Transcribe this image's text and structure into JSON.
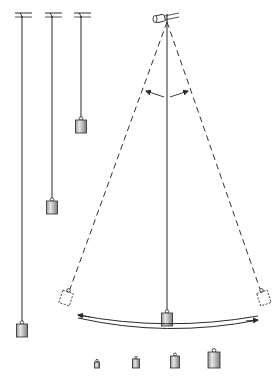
{
  "diagram": {
    "colors": {
      "line": "#2a2a2a",
      "bob_fill_light": "#e8e8e8",
      "bob_fill_dark": "#8a8a8a",
      "dashed": "#333333",
      "background": "#ffffff"
    },
    "fixed_pendulums": [
      {
        "id": "long",
        "x": 22,
        "top": 16,
        "bob_y": 321,
        "bob_w": 11,
        "bob_h": 13
      },
      {
        "id": "medium",
        "x": 52,
        "top": 16,
        "bob_y": 198,
        "bob_w": 11,
        "bob_h": 13
      },
      {
        "id": "short",
        "x": 81,
        "top": 16,
        "bob_y": 117,
        "bob_w": 11,
        "bob_h": 13
      }
    ],
    "swinging_pendulum": {
      "pivot": {
        "x": 167,
        "y": 22
      },
      "center_bob": {
        "x": 167,
        "y": 310
      },
      "left_bob": {
        "x": 70,
        "y": 297
      },
      "right_bob": {
        "x": 260,
        "y": 297
      },
      "angle_arrows": true,
      "swing_arrow": true
    },
    "weights": [
      {
        "id": "weight-1",
        "x": 97,
        "y": 368,
        "w": 5,
        "h": 6
      },
      {
        "id": "weight-2",
        "x": 136,
        "y": 368,
        "w": 7,
        "h": 9
      },
      {
        "id": "weight-3",
        "x": 175,
        "y": 368,
        "w": 9,
        "h": 12
      },
      {
        "id": "weight-4",
        "x": 214,
        "y": 368,
        "w": 12,
        "h": 16
      }
    ]
  }
}
